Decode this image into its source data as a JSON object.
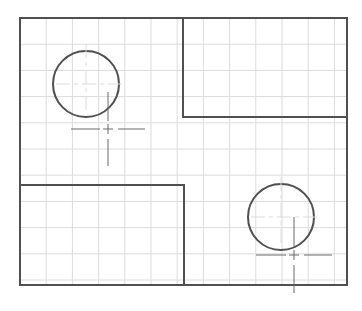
{
  "diagram": {
    "width": 362,
    "height": 311,
    "colors": {
      "background": "#ffffff",
      "grid": "#dcdcdc",
      "stroke": "#505050",
      "centerline": "#6a6a6a"
    },
    "grid": {
      "x0": 20,
      "y0": 18,
      "x1": 347,
      "y1": 285,
      "spacing": 26.2
    },
    "outer_frame": {
      "x": 20,
      "y": 18,
      "w": 327,
      "h": 267
    },
    "rectangles": [
      {
        "name": "top-right-block",
        "x": 183,
        "y": 18,
        "w": 164,
        "h": 99
      },
      {
        "name": "bottom-left-block",
        "x": 20,
        "y": 185,
        "w": 164,
        "h": 100
      }
    ],
    "circles": [
      {
        "name": "top-left-circle",
        "cx": 86,
        "cy": 84,
        "r": 33
      },
      {
        "name": "bottom-right-circle",
        "cx": 281,
        "cy": 217,
        "r": 33
      }
    ],
    "crosshairs": [
      {
        "name": "top-left-crosshair",
        "cx": 108,
        "cy": 129,
        "half": 37
      },
      {
        "name": "bottom-right-crosshair",
        "cx": 294,
        "cy": 255,
        "half": 38
      }
    ],
    "circle_centers": [
      {
        "cx": 86,
        "cy": 84
      },
      {
        "cx": 281,
        "cy": 217
      }
    ]
  }
}
